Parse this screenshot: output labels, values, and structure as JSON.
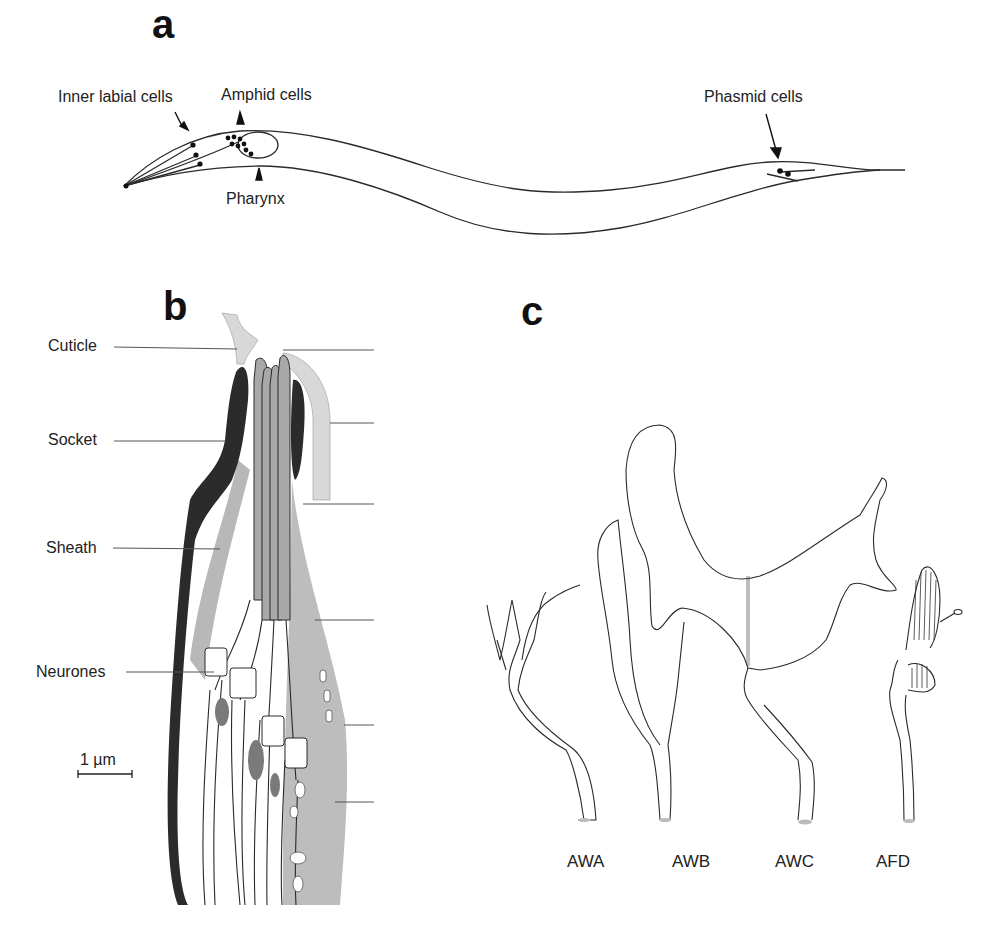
{
  "panels": {
    "a": {
      "letter": "a",
      "labels": {
        "inner_labial": "Inner labial cells",
        "amphid": "Amphid cells",
        "pharynx": "Pharynx",
        "phasmid": "Phasmid cells"
      }
    },
    "b": {
      "letter": "b",
      "labels": {
        "cuticle": "Cuticle",
        "socket": "Socket",
        "sheath": "Sheath",
        "neurones": "Neurones"
      },
      "scale_bar": "1 µm"
    },
    "c": {
      "letter": "c",
      "neurons": [
        "AWA",
        "AWB",
        "AWC",
        "AFD"
      ]
    }
  },
  "colors": {
    "line": "#2a2a2a",
    "socket": "#2b2b2b",
    "sheath": "#b8b8b8",
    "cuticle": "#d9d9d9",
    "background": "#ffffff"
  }
}
